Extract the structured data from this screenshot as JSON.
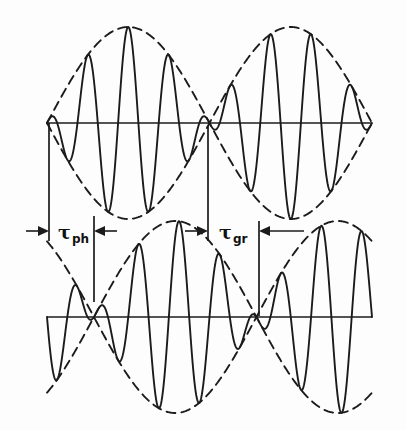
{
  "figure": {
    "background_color": "#fdfdfd",
    "line_color": "#1b1b1b",
    "width": 406,
    "height": 430
  },
  "labels": {
    "phase_delay": {
      "symbol": "τ",
      "subscript": "ph",
      "full": "τph"
    },
    "group_delay": {
      "symbol": "τ",
      "subscript": "gr",
      "full": "τgr"
    }
  },
  "chart_data": {
    "type": "line",
    "title": "",
    "xlabel": "",
    "ylabel": "",
    "grid": false,
    "legend": "none",
    "axis_style": "single horizontal zero-line per panel, no tick labels",
    "panels": [
      {
        "name": "upper-wave",
        "axis_y": 123,
        "x_range": [
          47,
          372
        ],
        "amplitude": 96,
        "carrier_periods": 8.0,
        "carrier_phase_deg": 90,
        "envelope_periods": 1.0,
        "envelope_phase_deg": 0,
        "envelope_node_x": 208,
        "description": "Amplitude-modulated carrier with dashed upper and lower envelope; envelope node (beat minimum) near horizontal center."
      },
      {
        "name": "lower-wave",
        "axis_y": 317,
        "x_range": [
          47,
          372
        ],
        "amplitude": 96,
        "carrier_periods": 8.0,
        "carrier_phase_deg": 0,
        "envelope_periods": 1.0,
        "envelope_phase_deg": -52,
        "envelope_node_x": 259,
        "description": "Same carrier delayed by tau-ph and envelope delayed by tau-gr; node shifted right relative to upper panel."
      }
    ],
    "annotations": [
      {
        "name": "phase-delay-measure",
        "label": "τph",
        "x_start": 49,
        "x_end": 94,
        "y": 231,
        "span_px": 45,
        "arrows": "inward double-headed between two vertical reference ticks"
      },
      {
        "name": "group-delay-measure",
        "label": "τgr",
        "x_start": 208,
        "x_end": 259,
        "y": 231,
        "span_px": 51,
        "arrows": "inward double-headed between two vertical reference ticks"
      }
    ],
    "reference_lines": [
      {
        "name": "upper-carrier-peak-ref",
        "x": 49,
        "y_from": 123,
        "y_to": 240
      },
      {
        "name": "lower-carrier-peak-ref",
        "x": 94,
        "y_from": 218,
        "y_to": 300
      },
      {
        "name": "upper-envelope-node-ref",
        "x": 208,
        "y_from": 126,
        "y_to": 240
      },
      {
        "name": "lower-envelope-node-ref",
        "x": 259,
        "y_from": 222,
        "y_to": 315
      }
    ]
  }
}
